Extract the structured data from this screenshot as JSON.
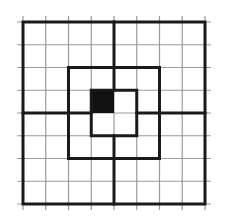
{
  "diagram": {
    "type": "grid-puzzle",
    "grid": {
      "rows": 8,
      "cols": 8,
      "origin_x": 23,
      "origin_y": 22,
      "cell_size": 22.75,
      "tick_overhang": 6
    },
    "colors": {
      "background": "#ffffff",
      "thin_line": "#9a9a9a",
      "bold_line": "#1a1a1a",
      "filled_cell": "#111111"
    },
    "thin_line_width": 1.2,
    "bold_line_width": 3,
    "bold_rectangles": [
      {
        "name": "outer-square",
        "col0": 0,
        "row0": 0,
        "col1": 8,
        "row1": 8
      },
      {
        "name": "middle-square",
        "col0": 2,
        "row0": 2,
        "col1": 6,
        "row1": 6
      },
      {
        "name": "inner-square",
        "col0": 3,
        "row0": 3,
        "col1": 5,
        "row1": 5
      }
    ],
    "bold_segments": [
      {
        "name": "top-divider",
        "c0": 4,
        "r0": 0,
        "c1": 4,
        "r1": 3
      },
      {
        "name": "bottom-divider",
        "c0": 4,
        "r0": 5,
        "c1": 4,
        "r1": 8
      },
      {
        "name": "left-divider",
        "c0": 0,
        "r0": 4,
        "c1": 3,
        "r1": 4
      },
      {
        "name": "right-divider",
        "c0": 5,
        "r0": 4,
        "c1": 8,
        "r1": 4
      }
    ],
    "filled_cells": [
      {
        "name": "black-cell",
        "col": 3,
        "row": 3
      }
    ]
  }
}
